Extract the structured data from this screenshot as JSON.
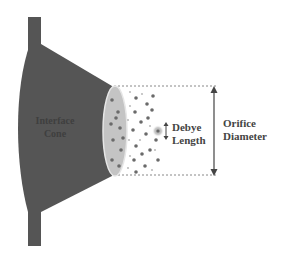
{
  "diagram": {
    "title": "",
    "labels": {
      "cone_line1": "Interface",
      "cone_line2": "Cone",
      "debye_line1": "Debye",
      "debye_line2": "Length",
      "orifice_line1": "Orifice",
      "orifice_line2": "Diameter"
    },
    "colors": {
      "cone": "#555555",
      "cone_text": "#444444",
      "orifice_face": "#c4c4c4",
      "orifice_rim": "#e6e6e6",
      "particle": "#6a6a6a",
      "particle_light": "#bdbdbd",
      "arrow": "#444444",
      "dotted": "#888888",
      "label": "#444444"
    },
    "particles": [
      [
        112,
        100
      ],
      [
        118,
        112
      ],
      [
        111,
        124
      ],
      [
        120,
        128
      ],
      [
        113,
        140
      ],
      [
        121,
        150
      ],
      [
        112,
        160
      ],
      [
        119,
        166
      ],
      [
        116,
        118
      ],
      [
        123,
        138
      ],
      [
        136,
        98
      ],
      [
        147,
        104
      ],
      [
        135,
        112
      ],
      [
        141,
        122
      ],
      [
        133,
        130
      ],
      [
        146,
        134
      ],
      [
        136,
        146
      ],
      [
        142,
        154
      ],
      [
        134,
        160
      ],
      [
        145,
        166
      ],
      [
        136,
        172
      ],
      [
        153,
        96
      ],
      [
        152,
        110
      ],
      [
        156,
        140
      ],
      [
        150,
        150
      ],
      [
        158,
        160
      ],
      [
        148,
        118
      ]
    ],
    "particles_small": [
      [
        130,
        92
      ],
      [
        142,
        94
      ],
      [
        130,
        106
      ],
      [
        128,
        120
      ],
      [
        150,
        126
      ],
      [
        129,
        140
      ],
      [
        140,
        140
      ],
      [
        155,
        150
      ],
      [
        130,
        156
      ],
      [
        152,
        170
      ],
      [
        128,
        168
      ]
    ],
    "highlight_particle": [
      158,
      131
    ]
  }
}
